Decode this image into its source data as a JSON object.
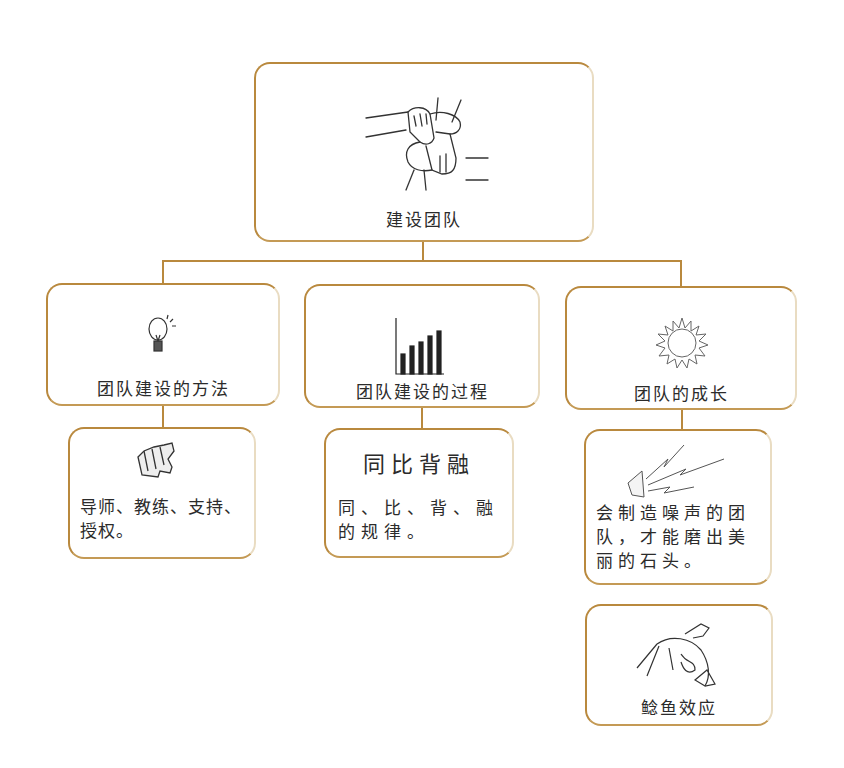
{
  "root": {
    "label": "建设团队",
    "icon": "joined-hands-icon"
  },
  "branches": [
    {
      "label": "团队建设的方法",
      "icon": "lightbulb-icon",
      "children": [
        {
          "icon": "fist-icon",
          "text": "导师、教练、支持、授权。"
        }
      ]
    },
    {
      "label": "团队建设的过程",
      "icon": "bar-chart-icon",
      "children": [
        {
          "title": "同比背融",
          "text": "同、比、背、融的规律。"
        }
      ]
    },
    {
      "label": "团队的成长",
      "icon": "sun-icon",
      "children": [
        {
          "icon": "megaphone-icon",
          "text": "会制造噪声的团队，才能磨出美丽的石头。"
        },
        {
          "icon": "catfish-icon",
          "label": "鲶鱼效应"
        }
      ]
    }
  ],
  "colors": {
    "border": "#b9893e",
    "text": "#2b2b2b",
    "background": "#ffffff"
  }
}
